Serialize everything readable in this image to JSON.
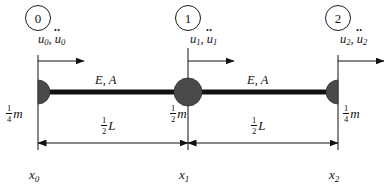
{
  "figure": {
    "type": "finite-element-bar-lumped-mass-diagram",
    "bar": {
      "material_label_left": "E, A",
      "material_label_right": "E, A"
    },
    "nodes": [
      {
        "index_label": "0",
        "dof_disp": "u",
        "dof_sub": "0",
        "dof_accel": "u",
        "dof_text": "u0, ü0",
        "mass_num": "1",
        "mass_den": "4",
        "mass_sym": "m",
        "coord_sym": "x",
        "coord_sub": "0",
        "mass_shape": "half-circle-right"
      },
      {
        "index_label": "1",
        "dof_disp": "u",
        "dof_sub": "1",
        "dof_accel": "u",
        "dof_text": "u1, ü1",
        "mass_num": "1",
        "mass_den": "2",
        "mass_sym": "m",
        "coord_sym": "x",
        "coord_sub": "1",
        "mass_shape": "full-circle"
      },
      {
        "index_label": "2",
        "dof_disp": "u",
        "dof_sub": "2",
        "dof_accel": "u",
        "dof_text": "u2, ü2",
        "mass_num": "1",
        "mass_den": "4",
        "mass_sym": "m",
        "coord_sym": "x",
        "coord_sub": "2",
        "mass_shape": "half-circle-left"
      }
    ],
    "dimensions": [
      {
        "num": "1",
        "den": "2",
        "sym": "L"
      },
      {
        "num": "1",
        "den": "2",
        "sym": "L"
      }
    ],
    "colors": {
      "stroke": "#111111",
      "mass_fill": "#4a4a4a",
      "background": "#ffffff"
    }
  }
}
